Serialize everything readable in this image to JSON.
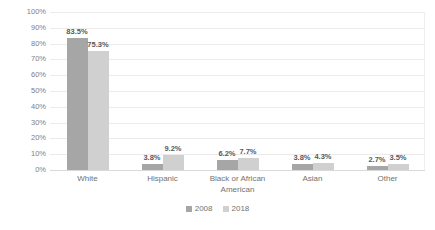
{
  "chart_data": {
    "type": "bar",
    "title": "",
    "subtitle": "",
    "xlabel": "",
    "ylabel": "",
    "categories": [
      "White",
      "Hispanic",
      "Black or African American",
      "Asian",
      "Other"
    ],
    "series": [
      {
        "name": "2008",
        "color": "#a6a6a6",
        "values": [
          83.5,
          3.8,
          6.2,
          3.8,
          2.7
        ],
        "value_labels": [
          "83.5%",
          "3.8%",
          "6.2%",
          "3.8%",
          "2.7%"
        ]
      },
      {
        "name": "2018",
        "color": "#d0d0d0",
        "values": [
          75.3,
          9.2,
          7.7,
          4.3,
          3.5
        ],
        "value_labels": [
          "75.3%",
          "9.2%",
          "7.7%",
          "4.3%",
          "3.5%"
        ]
      }
    ],
    "ylim": [
      0,
      100
    ],
    "ytick_values": [
      100,
      90,
      80,
      70,
      60,
      50,
      40,
      30,
      20,
      10,
      0
    ],
    "ytick_labels": [
      "100%",
      "90%",
      "80%",
      "70%",
      "60%",
      "50%",
      "40%",
      "30%",
      "20%",
      "10%",
      "0%"
    ],
    "grid": true,
    "legend_position": "bottom",
    "legend_entries": [
      "2008",
      "2018"
    ],
    "background": "#ffffff"
  }
}
